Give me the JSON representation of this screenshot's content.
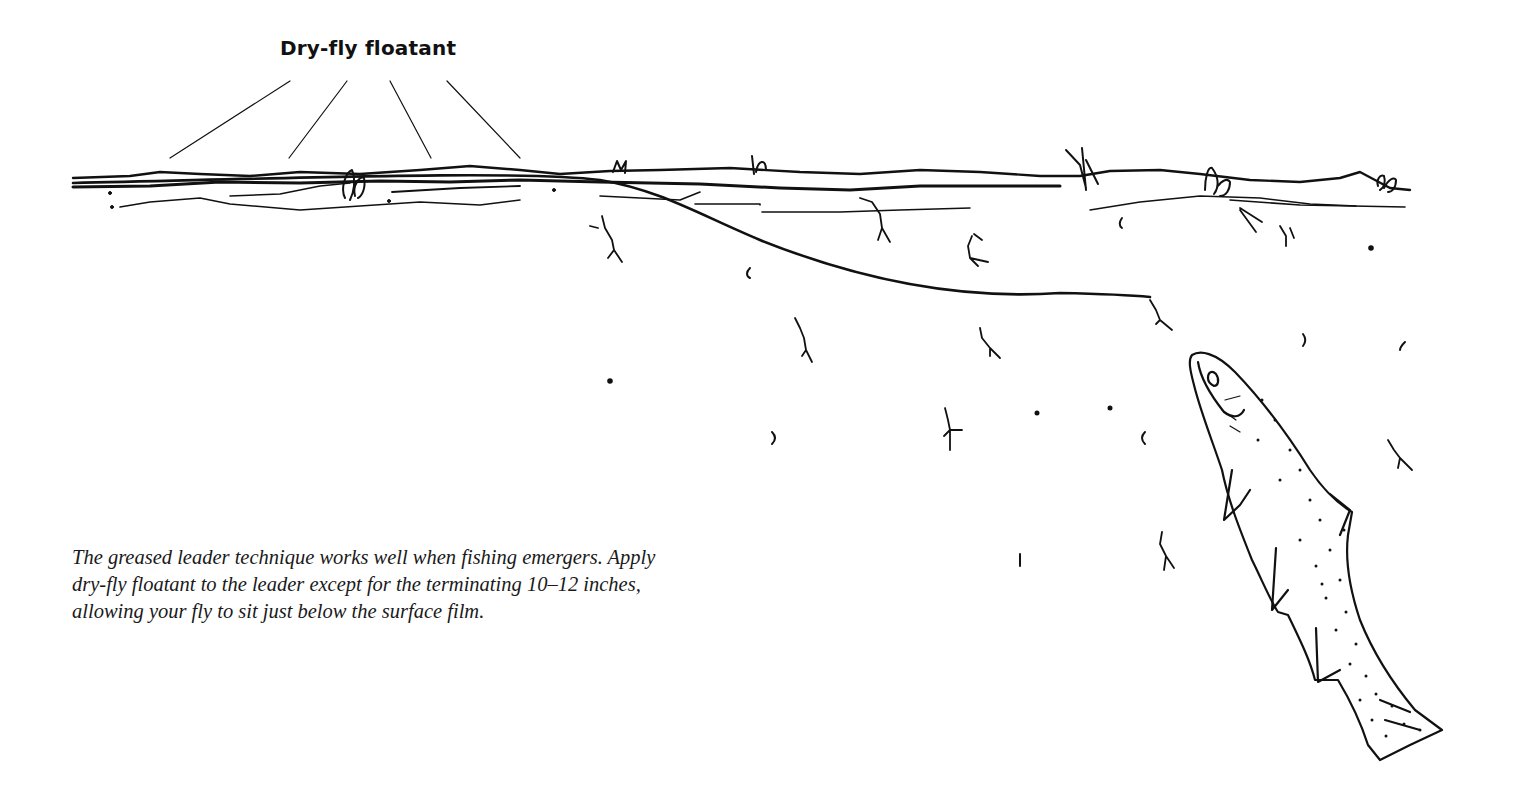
{
  "figure": {
    "label": "Dry-fly floatant",
    "caption_lines": [
      "The greased leader technique works well when fishing emergers. Apply",
      "dry-fly floatant to the leader except for the terminating 10–12 inches,",
      "allowing your fly to sit just below the surface film."
    ],
    "elements": [
      "water-surface",
      "greased-leader",
      "submerged-emerger-fly",
      "mayfly-duns",
      "emerging-nymphs",
      "rising-trout"
    ],
    "colors": {
      "ink": "#111111",
      "background": "#ffffff"
    }
  }
}
